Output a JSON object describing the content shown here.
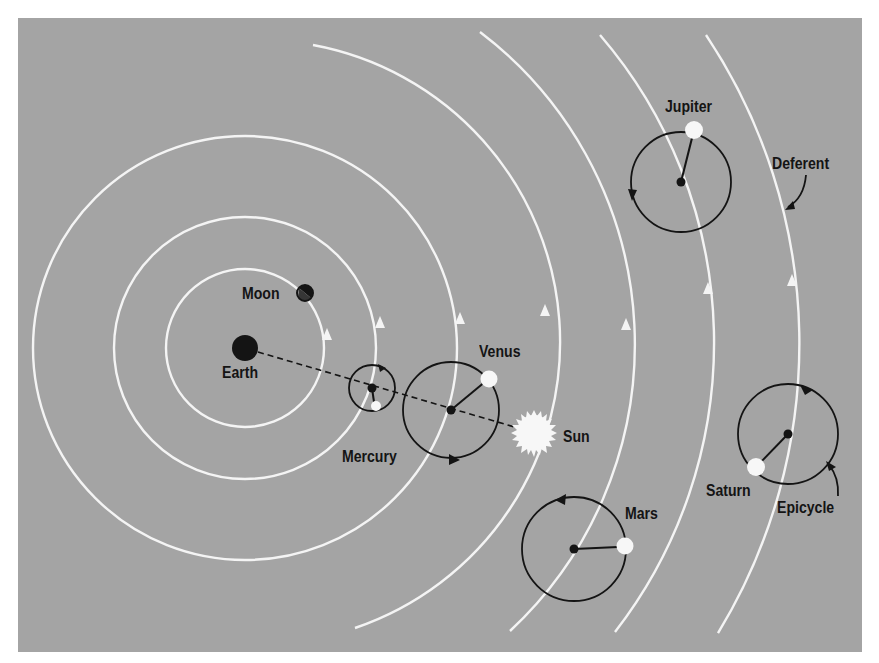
{
  "diagram": {
    "colors": {
      "background": "#a4a4a4",
      "page": "#ffffff",
      "orbit": "#f4f4f4",
      "ink": "#141414",
      "planet": "#f7f7f7"
    },
    "center": {
      "name": "Earth",
      "x": 245,
      "y": 348
    },
    "deferents": [
      {
        "body": "Moon",
        "r": 82
      },
      {
        "body": "Mercury",
        "r": 135
      },
      {
        "body": "Venus",
        "r": 215
      },
      {
        "body": "Sun",
        "r": 302
      },
      {
        "body": "Mars",
        "r": 390
      },
      {
        "body": "Jupiter",
        "r": 472
      },
      {
        "body": "Saturn",
        "r": 556
      }
    ],
    "labels": {
      "earth": "Earth",
      "moon": "Moon",
      "mercury": "Mercury",
      "venus": "Venus",
      "sun": "Sun",
      "mars": "Mars",
      "jupiter": "Jupiter",
      "saturn": "Saturn",
      "deferent": "Deferent",
      "epicycle": "Epicycle"
    }
  }
}
